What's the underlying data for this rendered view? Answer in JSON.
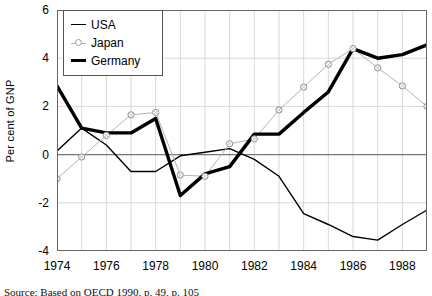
{
  "chart_data": {
    "type": "line",
    "title": "",
    "subtitle": "",
    "xlabel": "",
    "ylabel": "Per cent of GNP",
    "x": [
      1974,
      1975,
      1976,
      1977,
      1978,
      1979,
      1980,
      1981,
      1982,
      1983,
      1984,
      1985,
      1986,
      1987,
      1988,
      1989
    ],
    "xlim": [
      1974,
      1989
    ],
    "ylim": [
      -4,
      6
    ],
    "yticks": [
      6,
      4,
      2,
      0,
      -2,
      -4
    ],
    "ytick_labels": [
      "6",
      "4",
      "2",
      "0",
      "-2",
      "-4"
    ],
    "xticks": [
      1974,
      1975,
      1976,
      1977,
      1978,
      1979,
      1980,
      1981,
      1982,
      1983,
      1984,
      1985,
      1986,
      1987,
      1988,
      1989
    ],
    "xtick_labels_shown": [
      "1974",
      "1976",
      "1978",
      "1980",
      "1982",
      "1984",
      "1986",
      "1988"
    ],
    "xtick_label_years": [
      1974,
      1976,
      1978,
      1980,
      1982,
      1984,
      1986,
      1988
    ],
    "grid": true,
    "zero_line": true,
    "legend_position": "top-left",
    "series": [
      {
        "name": "USA",
        "color": "#000000",
        "width": 1.4,
        "marker": "none",
        "values": [
          0.15,
          1.1,
          0.4,
          -0.7,
          -0.7,
          -0.05,
          0.1,
          0.25,
          -0.2,
          -0.9,
          -2.45,
          -2.9,
          -3.4,
          -3.55,
          -2.9,
          -2.3
        ]
      },
      {
        "name": "Japan",
        "color": "#b3b3b3",
        "width": 1.0,
        "marker": "circle",
        "values": [
          -1.0,
          -0.1,
          0.8,
          1.65,
          1.75,
          -0.85,
          -0.9,
          0.45,
          0.65,
          1.85,
          2.8,
          3.75,
          4.4,
          3.6,
          2.85,
          2.0
        ]
      },
      {
        "name": "Germany",
        "color": "#000000",
        "width": 3.4,
        "marker": "none",
        "values": [
          2.85,
          1.1,
          0.9,
          0.9,
          1.5,
          -1.7,
          -0.8,
          -0.5,
          0.85,
          0.85,
          1.75,
          2.6,
          4.4,
          4.0,
          4.15,
          4.55
        ]
      }
    ]
  },
  "legend": {
    "items": [
      {
        "label": "USA",
        "key": "thin-line-key"
      },
      {
        "label": "Japan",
        "key": "circle-marker-line-key"
      },
      {
        "label": "Germany",
        "key": "thick-line-key"
      }
    ]
  },
  "source": {
    "text": "Source: Based on OECD 1990, p. 49, p. 105"
  }
}
